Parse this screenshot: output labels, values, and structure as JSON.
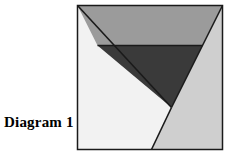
{
  "canvas": {
    "width": 226,
    "height": 159,
    "background": "#ffffff"
  },
  "label": {
    "text": "Diagram 1",
    "color": "#000000"
  },
  "figure": {
    "name": "inverted-triangle-square-diagram",
    "frame": {
      "x": 77,
      "y": 5,
      "width": 145,
      "height": 144,
      "border_color": "#1a1a1a",
      "border_width": 1.5
    },
    "colors": {
      "background_light": "#f2f2f2",
      "upper_band": "#9b9b9b",
      "lower_triangle": "#3a3a3a",
      "right_region": "#cfcfcf",
      "outline": "#1a1a1a"
    },
    "shapes": [
      {
        "name": "left-light-region",
        "fill": "#f2f2f2",
        "points": "0,0 0,144 74,144 94,102"
      },
      {
        "name": "right-light-gray-region",
        "fill": "#cfcfcf",
        "points": "145,0 145,144 74,144 94,102"
      },
      {
        "name": "upper-gray-band",
        "fill": "#9b9b9b",
        "points": "0,0 145,0 125,40 20,40"
      },
      {
        "name": "lower-dark-triangle",
        "fill": "#3a3a3a",
        "points": "20,40 125,40 94,102"
      }
    ],
    "lines": [
      {
        "name": "left-diagonal",
        "from": "0,0",
        "to": "94,102"
      },
      {
        "name": "right-diagonal",
        "from": "145,0",
        "to": "94,102"
      },
      {
        "name": "horizontal-divider",
        "from": "20,40",
        "to": "125,40"
      },
      {
        "name": "lower-left-diagonal",
        "from": "94,102",
        "to": "74,144"
      }
    ]
  }
}
